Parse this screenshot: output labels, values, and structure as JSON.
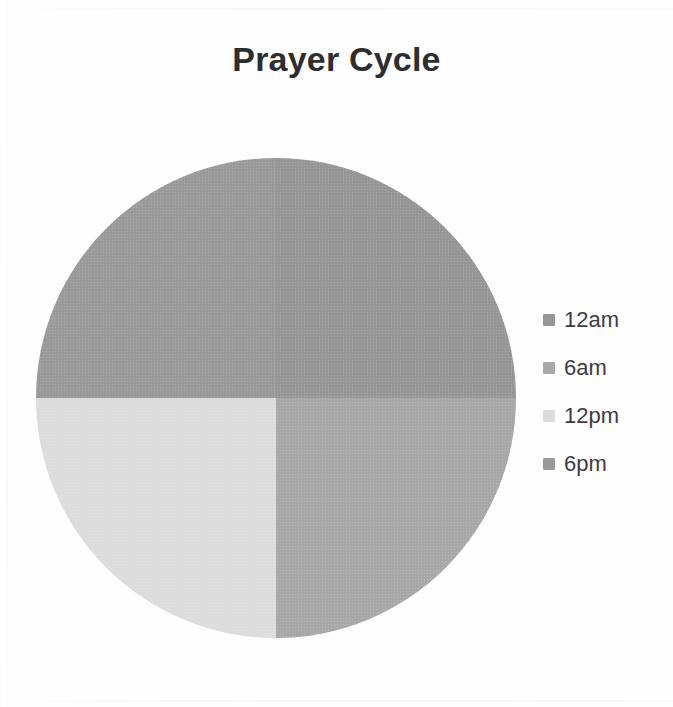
{
  "chart_data": {
    "type": "pie",
    "title": "Prayer Cycle",
    "categories": [
      "12am",
      "6am",
      "12pm",
      "6pm"
    ],
    "values": [
      25,
      25,
      25,
      25
    ],
    "value_unit": "percent",
    "colors": [
      "#969696",
      "#a8a8a8",
      "#dcdcdc",
      "#9a9a9a"
    ],
    "legend_position": "right",
    "grid": false,
    "data_labels_shown": false,
    "slices": [
      {
        "label": "12am",
        "value": 25,
        "color": "#969696",
        "start_angle": 0,
        "end_angle": 90,
        "quadrant": "top-left"
      },
      {
        "label": "6am",
        "value": 25,
        "color": "#a8a8a8",
        "start_angle": 90,
        "end_angle": 180,
        "quadrant": "top-right"
      },
      {
        "label": "12pm",
        "value": 25,
        "color": "#dcdcdc",
        "start_angle": 180,
        "end_angle": 270,
        "quadrant": "bottom-left"
      },
      {
        "label": "6pm",
        "value": 25,
        "color": "#9a9a9a",
        "start_angle": 270,
        "end_angle": 360,
        "quadrant": "bottom-right"
      }
    ]
  },
  "title": {
    "text": "Prayer Cycle"
  },
  "legend": {
    "items": [
      {
        "label": "12am",
        "color": "#969696"
      },
      {
        "label": "6am",
        "color": "#a8a8a8"
      },
      {
        "label": "12pm",
        "color": "#dcdcdc"
      },
      {
        "label": "6pm",
        "color": "#9a9a9a"
      }
    ]
  }
}
